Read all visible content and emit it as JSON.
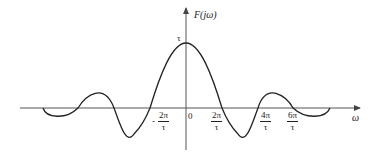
{
  "diagram": {
    "type": "sinc-spectrum plot",
    "y_axis_label": "F(jω)",
    "x_axis_label": "ω",
    "peak_label": "τ",
    "origin_label": "0",
    "tick_labels": [
      {
        "sign": "-",
        "numerator": "2π",
        "denominator": "τ"
      },
      {
        "sign": "",
        "numerator": "2π",
        "denominator": "τ"
      },
      {
        "sign": "",
        "numerator": "4π",
        "denominator": "τ"
      },
      {
        "sign": "",
        "numerator": "6π",
        "denominator": "τ"
      }
    ],
    "colors": {
      "curve": "#222222",
      "axis": "#555555",
      "background": "#ffffff"
    }
  }
}
